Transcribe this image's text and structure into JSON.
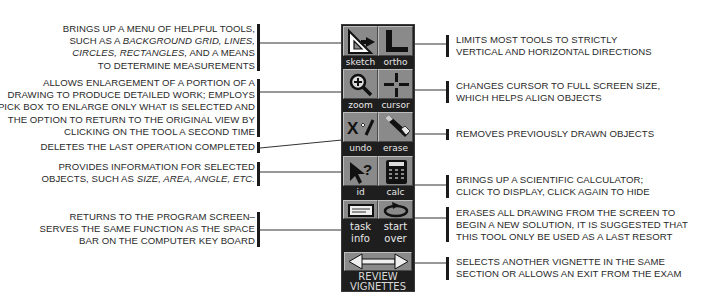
{
  "toolbar": {
    "tools": [
      {
        "id": "sketch",
        "label": "sketch",
        "icon": "triangle-ruler-icon"
      },
      {
        "id": "ortho",
        "label": "ortho",
        "icon": "l-square-icon"
      },
      {
        "id": "zoom",
        "label": "zoom",
        "icon": "magnifier-plus-icon"
      },
      {
        "id": "cursor",
        "label": "cursor",
        "icon": "crosshair-icon"
      },
      {
        "id": "undo",
        "label": "undo",
        "icon": "x-check-icon"
      },
      {
        "id": "erase",
        "label": "erase",
        "icon": "eraser-icon"
      },
      {
        "id": "id",
        "label": "id",
        "icon": "arrow-question-icon"
      },
      {
        "id": "calc",
        "label": "calc",
        "icon": "calculator-icon"
      },
      {
        "id": "task_info",
        "label_line1": "task",
        "label_line2": "info",
        "icon": "card-icon"
      },
      {
        "id": "start_over",
        "label_line1": "start",
        "label_line2": "over",
        "icon": "circular-arrow-icon"
      }
    ],
    "review": {
      "label_line1": "REVIEW",
      "label_line2": "VIGNETTES",
      "icon": "double-arrow-icon"
    }
  },
  "descriptions": {
    "sketch": {
      "line1": "BRINGS UP A MENU OF HELPFUL TOOLS,",
      "line2_pre": "SUCH AS A ",
      "line2_it": "BACKGROUND GRID, LINES,",
      "line3_it": "CIRCLES, RECTANGLES,",
      "line3_post": " AND A MEANS",
      "line4": "TO DETERMINE MEASUREMENTS"
    },
    "zoom": {
      "line1": "ALLOWS ENLARGEMENT OF A PORTION OF A",
      "line2": "DRAWING TO PRODUCE DETAILED WORK; EMPLOYS",
      "line3": "A PICK BOX TO ENLARGE ONLY WHAT IS SELECTED AND",
      "line4": "THE OPTION TO RETURN TO THE ORIGINAL VIEW BY",
      "line5": "CLICKING ON THE TOOL A SECOND TIME"
    },
    "undo": {
      "line1": "DELETES THE LAST OPERATION COMPLETED"
    },
    "id": {
      "line1": "PROVIDES INFORMATION FOR SELECTED",
      "line2_pre": "OBJECTS, SUCH AS ",
      "line2_it": "SIZE, AREA, ANGLE, ETC."
    },
    "task_info": {
      "line1": "RETURNS TO THE PROGRAM SCREEN–",
      "line2": "SERVES THE SAME FUNCTION AS THE SPACE",
      "line3": "BAR ON THE COMPUTER KEY BOARD"
    },
    "ortho": {
      "line1": "LIMITS MOST TOOLS TO STRICTLY",
      "line2": "VERTICAL AND HORIZONTAL DIRECTIONS"
    },
    "cursor": {
      "line1": "CHANGES CURSOR TO FULL SCREEN SIZE,",
      "line2": "WHICH HELPS ALIGN OBJECTS"
    },
    "erase": {
      "line1": "REMOVES PREVIOUSLY DRAWN OBJECTS"
    },
    "calc": {
      "line1": "BRINGS UP A SCIENTIFIC CALCULATOR;",
      "line2": "CLICK TO DISPLAY, CLICK AGAIN TO HIDE"
    },
    "start_over": {
      "line1": "ERASES ALL DRAWING FROM THE SCREEN TO",
      "line2": "BEGIN A NEW SOLUTION, IT IS SUGGESTED THAT",
      "line3": "THIS TOOL ONLY BE USED AS A LAST RESORT"
    },
    "review": {
      "line1": "SELECTS ANOTHER VIGNETTE IN THE SAME",
      "line2": "SECTION OR ALLOWS AN EXIT FROM THE EXAM"
    }
  },
  "colors": {
    "toolbar_bg": "#1e1e1e",
    "button_face": "#8a8a8a",
    "label_text": "#e8e8e8",
    "text": "#2a2a2a"
  }
}
